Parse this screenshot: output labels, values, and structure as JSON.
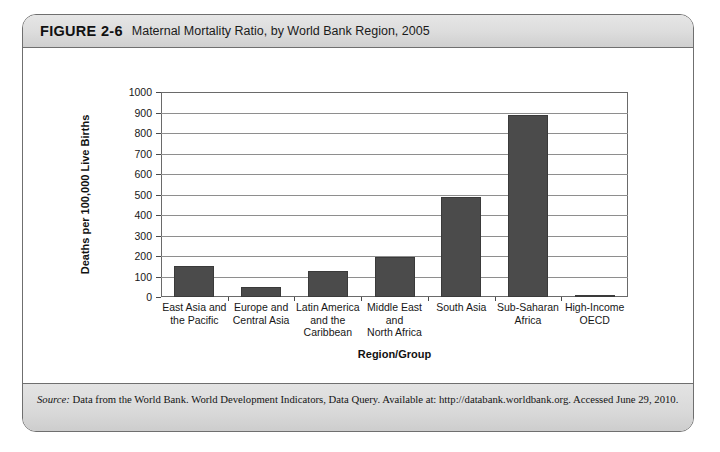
{
  "figure": {
    "number": "FIGURE 2-6",
    "title": "Maternal Mortality Ratio, by World Bank Region, 2005",
    "source_label": "Source:",
    "source_text": "Data from the World Bank. World Development Indicators, Data Query. Available at: http://databank.worldbank.org. Accessed June 29, 2010."
  },
  "chart_data": {
    "type": "bar",
    "title": "Maternal Mortality Ratio, by World Bank Region, 2005",
    "xlabel": "Region/Group",
    "ylabel": "Deaths per 100,000 Live Births",
    "ylim": [
      0,
      1000
    ],
    "ytick_step": 100,
    "yticks": [
      1000,
      900,
      800,
      700,
      600,
      500,
      400,
      300,
      200,
      100,
      0
    ],
    "grid": true,
    "legend": "none",
    "bar_color": "#4b4b4b",
    "categories": [
      "East Asia and\nthe Pacific",
      "Europe and\nCentral Asia",
      "Latin America\nand the\nCaribbean",
      "Middle East\nand\nNorth Africa",
      "South Asia",
      "Sub-Saharan\nAfrica",
      "High-Income\nOECD"
    ],
    "categories_flat": [
      "East Asia and the Pacific",
      "Europe and Central Asia",
      "Latin America and the Caribbean",
      "Middle East and North Africa",
      "South Asia",
      "Sub-Saharan Africa",
      "High-Income OECD"
    ],
    "values": [
      150,
      50,
      125,
      195,
      490,
      890,
      8
    ]
  }
}
